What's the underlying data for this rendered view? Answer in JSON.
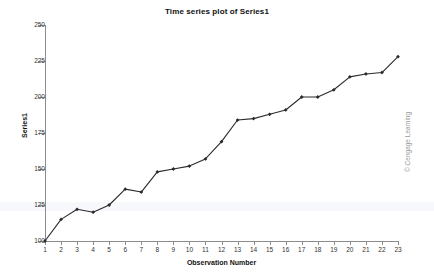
{
  "chart_data": {
    "type": "line",
    "title": "Time series plot of Series1",
    "xlabel": "Observation Number",
    "ylabel": "Series1",
    "x": [
      1,
      2,
      3,
      4,
      5,
      6,
      7,
      8,
      9,
      10,
      11,
      12,
      13,
      14,
      15,
      16,
      17,
      18,
      19,
      20,
      21,
      22,
      23
    ],
    "values": [
      100,
      115,
      122,
      120,
      125,
      136,
      134,
      148,
      150,
      152,
      157,
      169,
      184,
      185,
      188,
      191,
      200,
      200,
      205,
      214,
      216,
      217,
      228
    ],
    "series": [
      {
        "name": "Series1",
        "values": [
          100,
          115,
          122,
          120,
          125,
          136,
          134,
          148,
          150,
          152,
          157,
          169,
          184,
          185,
          188,
          191,
          200,
          200,
          205,
          214,
          216,
          217,
          228
        ]
      }
    ],
    "xtick_labels": [
      "1",
      "2",
      "3",
      "4",
      "5",
      "6",
      "7",
      "8",
      "9",
      "10",
      "11",
      "12",
      "13",
      "14",
      "15",
      "16",
      "17",
      "18",
      "19",
      "20",
      "21",
      "22",
      "23"
    ],
    "ytick_labels": [
      "250",
      "225",
      "200",
      "175",
      "150",
      "125",
      "100"
    ],
    "ytick_values": [
      250,
      225,
      200,
      175,
      150,
      125,
      100
    ],
    "xlim": [
      1,
      23
    ],
    "ylim": [
      100,
      250
    ],
    "grid": false,
    "legend": "none",
    "marker": "filled-diamond",
    "line_color": "#2b2b2b",
    "marker_color": "#2b2b2b",
    "axis_color": "#8c8c8c",
    "background": "#ffffff"
  },
  "credit": {
    "text": "© Cengage Learning",
    "color": "#9a9a9a"
  }
}
